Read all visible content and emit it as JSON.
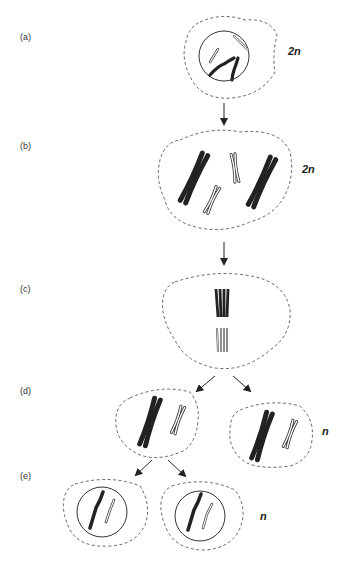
{
  "figure": {
    "stages": [
      {
        "id": "a",
        "label": "(a)",
        "ploidy": "2n"
      },
      {
        "id": "b",
        "label": "(b)",
        "ploidy": "2n"
      },
      {
        "id": "c",
        "label": "(c)",
        "ploidy": ""
      },
      {
        "id": "d",
        "label": "(d)",
        "ploidy": "n"
      },
      {
        "id": "e",
        "label": "(e)",
        "ploidy": "n"
      }
    ],
    "colors": {
      "chromosome_dark": "#222222",
      "outline": "#333333",
      "cell_border": "#555555"
    }
  }
}
